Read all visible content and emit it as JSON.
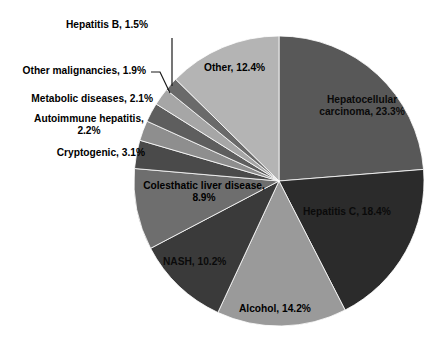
{
  "chart_data": {
    "type": "pie",
    "title": "",
    "subtitle": "",
    "xlabel": "",
    "ylabel": "",
    "legend_position": "none",
    "grid": false,
    "units": "percent",
    "total": 100.0,
    "start_angle_deg": 0,
    "direction": "clockwise",
    "categories": [
      "Hepatocellular carcinoma",
      "Hepatitis C",
      "Alcohol",
      "NASH",
      "Colesthatic liver disease",
      "Cryptogenic",
      "Autoimmune hepatitis",
      "Metabolic diseases",
      "Other malignancies",
      "Hepatitis B",
      "Other"
    ],
    "values": [
      23.3,
      18.4,
      14.2,
      10.2,
      8.9,
      3.1,
      2.2,
      2.1,
      1.9,
      1.5,
      12.4
    ],
    "colors": [
      "#585858",
      "#2b2b2b",
      "#9a9a9a",
      "#3a3a3a",
      "#6e6e6e",
      "#4a4a4a",
      "#8e8e8e",
      "#5e5e5e",
      "#a6a6a6",
      "#6a6a6a",
      "#b4b4b4"
    ],
    "slices": [
      {
        "label": "Hepatocellular carcinoma, 23.3%",
        "name": "Hepatocellular carcinoma",
        "value": 23.3,
        "color": "#585858",
        "label_placement": "inside",
        "label_line1": "Hepatocellular",
        "label_line2": "carcinoma, 23.3%"
      },
      {
        "label": "Hepatitis C, 18.4%",
        "name": "Hepatitis C",
        "value": 18.4,
        "color": "#2b2b2b",
        "label_placement": "inside"
      },
      {
        "label": "Alcohol, 14.2%",
        "name": "Alcohol",
        "value": 14.2,
        "color": "#9a9a9a",
        "label_placement": "inside"
      },
      {
        "label": "NASH, 10.2%",
        "name": "NASH",
        "value": 10.2,
        "color": "#3a3a3a",
        "label_placement": "inside"
      },
      {
        "label": "Colesthatic liver disease, 8.9%",
        "name": "Colesthatic liver disease",
        "value": 8.9,
        "color": "#6e6e6e",
        "label_placement": "inside",
        "label_line1": "Colesthatic liver disease,",
        "label_line2": "8.9%"
      },
      {
        "label": "Cryptogenic, 3.1%",
        "name": "Cryptogenic",
        "value": 3.1,
        "color": "#4a4a4a",
        "label_placement": "outside-left"
      },
      {
        "label": "Autoimmune hepatitis, 2.2%",
        "name": "Autoimmune hepatitis",
        "value": 2.2,
        "color": "#8e8e8e",
        "label_placement": "outside-left",
        "label_line1": "Autoimmune hepatitis,",
        "label_line2": "2.2%"
      },
      {
        "label": "Metabolic diseases, 2.1%",
        "name": "Metabolic diseases",
        "value": 2.1,
        "color": "#5e5e5e",
        "label_placement": "outside-left"
      },
      {
        "label": "Other malignancies, 1.9%",
        "name": "Other malignancies",
        "value": 1.9,
        "color": "#a6a6a6",
        "label_placement": "outside-left-leader"
      },
      {
        "label": "Hepatitis B, 1.5%",
        "name": "Hepatitis B",
        "value": 1.5,
        "color": "#6a6a6a",
        "label_placement": "outside-top-leader"
      },
      {
        "label": "Other, 12.4%",
        "name": "Other",
        "value": 12.4,
        "color": "#b4b4b4",
        "label_placement": "inside"
      }
    ]
  },
  "labels": {
    "hepatitis_b": "Hepatitis B, 1.5%",
    "other_malignancies": "Other malignancies, 1.9%",
    "metabolic_diseases": "Metabolic diseases, 2.1%",
    "autoimmune_hepatitis_l1": "Autoimmune hepatitis,",
    "autoimmune_hepatitis_l2": "2.2%",
    "cryptogenic": "Cryptogenic, 3.1%",
    "other": "Other, 12.4%",
    "hepatocellular_l1": "Hepatocellular",
    "hepatocellular_l2": "carcinoma, 23.3%",
    "hepatitis_c": "Hepatitis C, 18.4%",
    "colesthatic_l1": "Colesthatic liver disease,",
    "colesthatic_l2": "8.9%",
    "nash": "NASH, 10.2%",
    "alcohol": "Alcohol, 14.2%"
  },
  "geometry": {
    "center_x": 279,
    "center_y": 181,
    "radius": 145
  },
  "style": {
    "background": "#ffffff",
    "text_color": "#000000",
    "leader_color": "#1a1a1a"
  }
}
